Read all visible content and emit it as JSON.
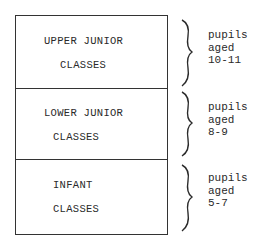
{
  "diagram": {
    "sections": [
      {
        "line1": "UPPER JUNIOR",
        "line2": "CLASSES",
        "bracket_label": [
          "pupils",
          "aged",
          "10-11"
        ]
      },
      {
        "line1": "LOWER JUNIOR",
        "line2": "CLASSES",
        "bracket_label": [
          "pupils",
          "aged",
          "8-9"
        ]
      },
      {
        "line1": "INFANT",
        "line2": "CLASSES",
        "bracket_label": [
          "pupils",
          "aged",
          "5-7"
        ]
      }
    ]
  }
}
